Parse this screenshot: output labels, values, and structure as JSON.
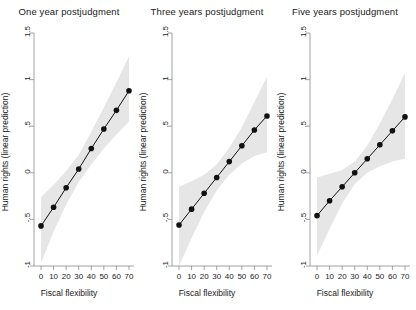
{
  "figure": {
    "width": 416,
    "height": 310,
    "background": "#ffffff",
    "band_color": "#e6e6e6",
    "line_color": "#111111",
    "axis_color": "#8c8c8c"
  },
  "chart_data": [
    {
      "type": "line",
      "title": "One year postjudgment",
      "xlabel": "Fiscal flexibility",
      "ylabel": "Human rights (linear prediction)",
      "x": [
        0,
        10,
        20,
        30,
        40,
        50,
        60,
        70
      ],
      "xticks": [
        "0",
        "10",
        "20",
        "30",
        "40",
        "50",
        "60",
        "70"
      ],
      "yticks": [
        "1.5",
        "1",
        ".5",
        "0",
        "-.5",
        "-1"
      ],
      "ytickvalues": [
        1.5,
        1,
        0.5,
        0,
        -0.5,
        -1
      ],
      "xlim": [
        -4,
        74
      ],
      "ylim": [
        -1,
        1.5
      ],
      "grid": false,
      "legend": "none",
      "series": [
        {
          "name": "Linear prediction",
          "values": [
            -0.57,
            -0.37,
            -0.16,
            0.04,
            0.26,
            0.47,
            0.67,
            0.88
          ],
          "ci_lower": [
            -0.97,
            -0.63,
            -0.34,
            -0.1,
            0.09,
            0.26,
            0.41,
            0.55
          ],
          "ci_upper": [
            -0.26,
            -0.13,
            0.02,
            0.19,
            0.44,
            0.7,
            0.97,
            1.25
          ]
        }
      ]
    },
    {
      "type": "line",
      "title": "Three years postjudgment",
      "xlabel": "Fiscal flexibility",
      "ylabel": "Human rights (linear prediction)",
      "x": [
        0,
        10,
        20,
        30,
        40,
        50,
        60,
        70
      ],
      "xticks": [
        "0",
        "10",
        "20",
        "30",
        "40",
        "50",
        "60",
        "70"
      ],
      "yticks": [
        "1.5",
        "1",
        ".5",
        "0",
        "-.5",
        "-1"
      ],
      "ytickvalues": [
        1.5,
        1,
        0.5,
        0,
        -0.5,
        -1
      ],
      "xlim": [
        -4,
        74
      ],
      "ylim": [
        -1,
        1.5
      ],
      "grid": false,
      "legend": "none",
      "series": [
        {
          "name": "Linear prediction",
          "values": [
            -0.56,
            -0.39,
            -0.22,
            -0.05,
            0.12,
            0.29,
            0.46,
            0.61
          ],
          "ci_lower": [
            -1.0,
            -0.7,
            -0.42,
            -0.19,
            -0.02,
            0.1,
            0.18,
            0.22
          ],
          "ci_upper": [
            -0.15,
            -0.09,
            -0.02,
            0.09,
            0.27,
            0.49,
            0.76,
            1.03
          ]
        }
      ]
    },
    {
      "type": "line",
      "title": "Five years postjudgment",
      "xlabel": "Fiscal flexibility",
      "ylabel": "Human rights (linear prediction)",
      "x": [
        0,
        10,
        20,
        30,
        40,
        50,
        60,
        70
      ],
      "xticks": [
        "0",
        "10",
        "20",
        "30",
        "40",
        "50",
        "60",
        "70"
      ],
      "yticks": [
        "1.5",
        "1",
        ".5",
        "0",
        "-.5",
        "-1"
      ],
      "ytickvalues": [
        1.5,
        1,
        0.5,
        0,
        -0.5,
        -1
      ],
      "xlim": [
        -4,
        74
      ],
      "ylim": [
        -1,
        1.5
      ],
      "grid": false,
      "legend": "none",
      "series": [
        {
          "name": "Linear prediction",
          "values": [
            -0.46,
            -0.3,
            -0.15,
            0.0,
            0.15,
            0.3,
            0.45,
            0.6
          ],
          "ci_lower": [
            -0.89,
            -0.6,
            -0.33,
            -0.12,
            0.0,
            0.07,
            0.12,
            0.15
          ],
          "ci_upper": [
            -0.05,
            -0.01,
            0.03,
            0.12,
            0.29,
            0.53,
            0.79,
            1.07
          ]
        }
      ]
    }
  ]
}
